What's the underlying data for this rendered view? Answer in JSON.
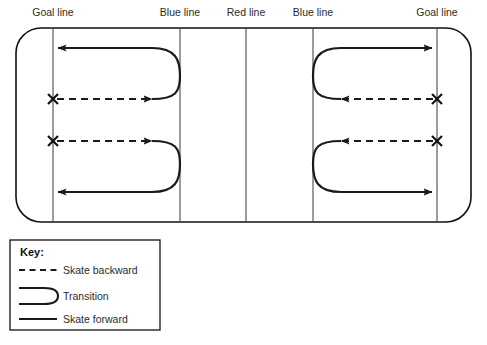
{
  "diagram": {
    "colors": {
      "ink": "#1a1a1a",
      "line": "#4a4a4a",
      "rink_border": "#111111",
      "background": "#ffffff",
      "label_text": "#2b2b2b"
    },
    "rink": {
      "left": 16,
      "top": 28,
      "right": 471,
      "bottom": 222,
      "corner_radius": 25
    },
    "zone_lines": [
      {
        "name": "goal-line-left",
        "label": "Goal line",
        "x": 53,
        "label_x": 53,
        "label_y": 16
      },
      {
        "name": "blue-line-left",
        "label": "Blue line",
        "x": 180,
        "label_x": 180,
        "label_y": 16
      },
      {
        "name": "red-line-center",
        "label": "Red line",
        "x": 246,
        "label_x": 246,
        "label_y": 16
      },
      {
        "name": "blue-line-right",
        "label": "Blue line",
        "x": 313,
        "label_x": 313,
        "label_y": 16
      },
      {
        "name": "goal-line-right",
        "label": "Goal line",
        "x": 437,
        "label_x": 437,
        "label_y": 16
      }
    ],
    "start_markers": [
      {
        "name": "start-x-top-left",
        "x": 53,
        "y": 99
      },
      {
        "name": "start-x-bottom-left",
        "x": 53,
        "y": 141
      },
      {
        "name": "start-x-top-right",
        "x": 437,
        "y": 99
      },
      {
        "name": "start-x-bottom-right",
        "x": 437,
        "y": 141
      }
    ],
    "paths": [
      {
        "name": "drill-path-top-left",
        "backward_segment": {
          "from_x": 57,
          "to_x": 152,
          "y": 99,
          "arrow": "right"
        },
        "transition_curve": "M152,99 C176,99 180,92 180,76 C180,60 176,48 152,48",
        "forward_segment": {
          "from_x": 152,
          "to_x": 58,
          "y": 48,
          "arrow": "left"
        }
      },
      {
        "name": "drill-path-bottom-left",
        "backward_segment": {
          "from_x": 57,
          "to_x": 152,
          "y": 141,
          "arrow": "right"
        },
        "transition_curve": "M152,141 C176,141 180,148 180,164 C180,180 176,192 152,192",
        "forward_segment": {
          "from_x": 152,
          "to_x": 58,
          "y": 192,
          "arrow": "left"
        }
      },
      {
        "name": "drill-path-top-right",
        "backward_segment": {
          "from_x": 433,
          "to_x": 341,
          "y": 99,
          "arrow": "left"
        },
        "transition_curve": "M341,99 C317,99 313,92 313,76 C313,60 317,48 341,48",
        "forward_segment": {
          "from_x": 341,
          "to_x": 432,
          "y": 48,
          "arrow": "right"
        }
      },
      {
        "name": "drill-path-bottom-right",
        "backward_segment": {
          "from_x": 433,
          "to_x": 341,
          "y": 141,
          "arrow": "left"
        },
        "transition_curve": "M341,141 C317,141 313,148 313,164 C313,180 317,192 341,192",
        "forward_segment": {
          "from_x": 341,
          "to_x": 432,
          "y": 192,
          "arrow": "right"
        }
      }
    ]
  },
  "legend": {
    "title": "Key:",
    "box": {
      "left": 10,
      "top": 240,
      "width": 150,
      "height": 90
    },
    "items": [
      {
        "name": "legend-skate-backward",
        "label": "Skate backward",
        "style": "dashed"
      },
      {
        "name": "legend-transition",
        "label": "Transition",
        "style": "curve"
      },
      {
        "name": "legend-skate-forward",
        "label": "Skate forward",
        "style": "solid"
      }
    ]
  }
}
